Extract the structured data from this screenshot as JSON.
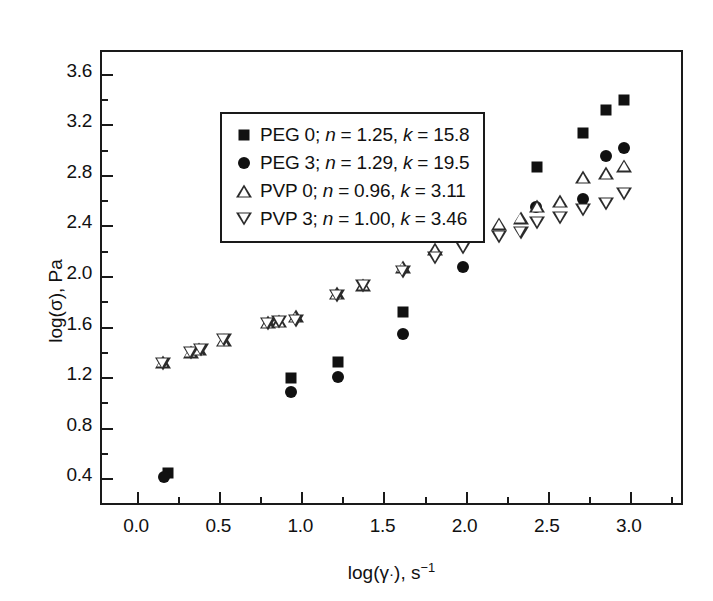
{
  "chart_data": {
    "type": "scatter",
    "title": "",
    "xlabel": "log(γ·), s⁻¹",
    "ylabel": "log(σ), Pa",
    "xlim": [
      -0.22,
      3.33
    ],
    "ylim": [
      0.18,
      3.78
    ],
    "xticks": [
      "0.0",
      "0.5",
      "1.0",
      "1.5",
      "2.0",
      "2.5",
      "3.0"
    ],
    "xtick_values": [
      0.0,
      0.5,
      1.0,
      1.5,
      2.0,
      2.5,
      3.0
    ],
    "yticks": [
      "0.4",
      "0.8",
      "1.2",
      "1.6",
      "2.0",
      "2.4",
      "2.8",
      "3.2",
      "3.6"
    ],
    "ytick_values": [
      0.4,
      0.8,
      1.2,
      1.6,
      2.0,
      2.4,
      2.8,
      3.2,
      3.6
    ],
    "minor_ticks": true,
    "grid": false,
    "legend_position": "top-left",
    "series": [
      {
        "name": "PEG 0",
        "label": "PEG 0; n = 1.25, k = 15.8",
        "marker": "filled-square",
        "color": "#111111",
        "n": 1.25,
        "k": 15.8,
        "points": [
          [
            0.18,
            0.45
          ],
          [
            0.93,
            1.2
          ],
          [
            1.22,
            1.33
          ],
          [
            1.61,
            1.72
          ],
          [
            2.43,
            2.87
          ],
          [
            2.71,
            3.14
          ],
          [
            2.85,
            3.32
          ],
          [
            2.96,
            3.4
          ]
        ]
      },
      {
        "name": "PEG 3",
        "label": "PEG 3; n = 1.29, k = 19.5",
        "marker": "filled-circle",
        "color": "#111111",
        "n": 1.29,
        "k": 19.5,
        "points": [
          [
            0.16,
            0.42
          ],
          [
            0.93,
            1.09
          ],
          [
            1.22,
            1.21
          ],
          [
            1.61,
            1.55
          ],
          [
            1.98,
            2.08
          ],
          [
            2.42,
            2.55
          ],
          [
            2.71,
            2.62
          ],
          [
            2.85,
            2.96
          ],
          [
            2.96,
            3.02
          ]
        ]
      },
      {
        "name": "PVP 0",
        "label": "PVP 0; n = 0.96, k = 3.11",
        "marker": "open-triangle-up",
        "color": "#2b2b2b",
        "n": 0.96,
        "k": 3.11,
        "points": [
          [
            0.15,
            1.33
          ],
          [
            0.32,
            1.41
          ],
          [
            0.37,
            1.43
          ],
          [
            0.52,
            1.5
          ],
          [
            0.79,
            1.64
          ],
          [
            0.86,
            1.65
          ],
          [
            0.96,
            1.69
          ],
          [
            1.21,
            1.87
          ],
          [
            1.37,
            1.94
          ],
          [
            1.61,
            2.08
          ],
          [
            1.81,
            2.22
          ],
          [
            1.98,
            2.33
          ],
          [
            2.2,
            2.42
          ],
          [
            2.33,
            2.47
          ],
          [
            2.43,
            2.56
          ],
          [
            2.57,
            2.6
          ],
          [
            2.71,
            2.79
          ],
          [
            2.85,
            2.82
          ],
          [
            2.96,
            2.88
          ]
        ]
      },
      {
        "name": "PVP 3",
        "label": "PVP 3; n = 1.00, k = 3.46",
        "marker": "open-triangle-down",
        "color": "#2b2b2b",
        "n": 1.0,
        "k": 3.46,
        "points": [
          [
            0.15,
            1.31
          ],
          [
            0.32,
            1.4
          ],
          [
            0.38,
            1.42
          ],
          [
            0.52,
            1.5
          ],
          [
            0.79,
            1.63
          ],
          [
            0.86,
            1.64
          ],
          [
            0.96,
            1.65
          ],
          [
            1.21,
            1.85
          ],
          [
            1.37,
            1.93
          ],
          [
            1.61,
            2.04
          ],
          [
            1.81,
            2.15
          ],
          [
            1.98,
            2.23
          ],
          [
            2.2,
            2.32
          ],
          [
            2.33,
            2.35
          ],
          [
            2.43,
            2.43
          ],
          [
            2.57,
            2.47
          ],
          [
            2.71,
            2.53
          ],
          [
            2.85,
            2.58
          ],
          [
            2.96,
            2.66
          ]
        ]
      }
    ]
  }
}
